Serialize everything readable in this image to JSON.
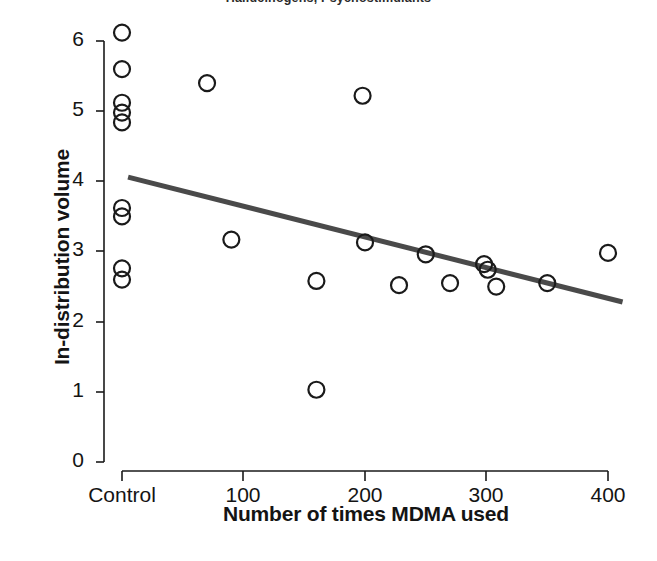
{
  "running_head": {
    "text": "Halluc­inogens, Psychostimulants"
  },
  "chart_data": {
    "type": "scatter",
    "title": "",
    "xlabel": "Number of times MDMA used",
    "ylabel": "In-distribution volume",
    "xlim": [
      0,
      400
    ],
    "ylim": [
      0,
      6
    ],
    "grid": false,
    "legend": null,
    "x_tick_labels": [
      "Control",
      "100",
      "200",
      "300",
      "400"
    ],
    "x_tick_values": [
      0,
      100,
      200,
      300,
      400
    ],
    "y_tick_labels": [
      "0",
      "1",
      "2",
      "3",
      "4",
      "5",
      "6"
    ],
    "y_tick_values": [
      0,
      1,
      2,
      3,
      4,
      5,
      6
    ],
    "marker": "open-circle",
    "marker_color": "#1a1a1a",
    "marker_fill": "none",
    "points": [
      {
        "x": 0,
        "y": 6.12,
        "group": "Control"
      },
      {
        "x": 0,
        "y": 5.6,
        "group": "Control"
      },
      {
        "x": 0,
        "y": 5.12,
        "group": "Control"
      },
      {
        "x": 0,
        "y": 4.98,
        "group": "Control"
      },
      {
        "x": 0,
        "y": 4.84,
        "group": "Control"
      },
      {
        "x": 0,
        "y": 3.62,
        "group": "Control"
      },
      {
        "x": 0,
        "y": 3.5,
        "group": "Control"
      },
      {
        "x": 0,
        "y": 2.76,
        "group": "Control"
      },
      {
        "x": 0,
        "y": 2.6,
        "group": "Control"
      },
      {
        "x": 70,
        "y": 5.4,
        "group": "MDMA"
      },
      {
        "x": 90,
        "y": 3.17,
        "group": "MDMA"
      },
      {
        "x": 160,
        "y": 2.58,
        "group": "MDMA"
      },
      {
        "x": 160,
        "y": 1.03,
        "group": "MDMA"
      },
      {
        "x": 198,
        "y": 5.22,
        "group": "MDMA"
      },
      {
        "x": 200,
        "y": 3.13,
        "group": "MDMA"
      },
      {
        "x": 228,
        "y": 2.52,
        "group": "MDMA"
      },
      {
        "x": 250,
        "y": 2.96,
        "group": "MDMA"
      },
      {
        "x": 270,
        "y": 2.55,
        "group": "MDMA"
      },
      {
        "x": 298,
        "y": 2.82,
        "group": "MDMA"
      },
      {
        "x": 301,
        "y": 2.74,
        "group": "MDMA"
      },
      {
        "x": 308,
        "y": 2.5,
        "group": "MDMA"
      },
      {
        "x": 350,
        "y": 2.55,
        "group": "MDMA"
      },
      {
        "x": 400,
        "y": 2.98,
        "group": "MDMA"
      }
    ],
    "trendline": {
      "type": "linear-fit",
      "color": "#4a4a4a",
      "x_start": 5,
      "y_start": 4.06,
      "x_end": 412,
      "y_end": 2.28
    }
  }
}
